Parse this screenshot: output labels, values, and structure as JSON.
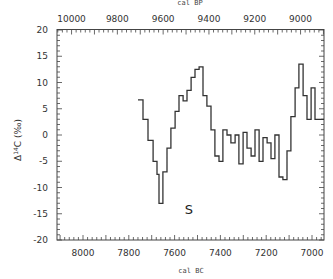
{
  "chart_data": {
    "type": "line",
    "style": "step",
    "title": "",
    "top_xlabel": "cal BP",
    "xlabel": "cal BC",
    "ylabel": "Δ14C (‰)",
    "ylabel_parts": {
      "delta": "Δ",
      "sup": "14",
      "rest": "C (‰)"
    },
    "annotation": "S",
    "xlim_bc": [
      8100,
      6930
    ],
    "ylim": [
      -20,
      20
    ],
    "yticks": [
      20,
      15,
      10,
      5,
      0,
      -5,
      -10,
      -15,
      -20
    ],
    "xticks_bottom": [
      8000,
      7800,
      7600,
      7400,
      7200,
      7000
    ],
    "xticks_top": [
      10000,
      9800,
      9600,
      9400,
      9200,
      9000
    ],
    "grid": false,
    "series": [
      {
        "name": "Δ14C",
        "x_cal_bc": [
          7760,
          7738,
          7716,
          7694,
          7677,
          7668,
          7651,
          7633,
          7616,
          7598,
          7581,
          7563,
          7546,
          7528,
          7511,
          7493,
          7476,
          7459,
          7441,
          7424,
          7406,
          7389,
          7371,
          7354,
          7336,
          7319,
          7301,
          7284,
          7266,
          7249,
          7231,
          7214,
          7196,
          7179,
          7162,
          7144,
          7127,
          7109,
          7092,
          7074,
          7057,
          7039,
          7022,
          7004,
          6987
        ],
        "values": [
          6.7,
          3,
          -1,
          -5,
          -7.5,
          -13,
          -7,
          -2.5,
          1.3,
          4.5,
          7.5,
          6.5,
          8.5,
          11,
          12.5,
          13,
          7.5,
          5.5,
          1,
          -4,
          -5,
          1,
          0,
          -1.5,
          0,
          -5.5,
          0.5,
          -2.5,
          -4,
          1,
          -5,
          -0.5,
          -1.5,
          -4.5,
          0,
          -8,
          -8.5,
          -3,
          3.5,
          9,
          13.5,
          7.5,
          3,
          9,
          3
        ],
        "end_x_cal_bc": 6930
      }
    ]
  }
}
